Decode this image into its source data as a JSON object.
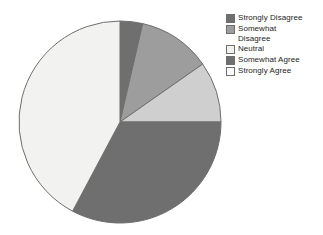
{
  "chart_data": {
    "type": "pie",
    "title": "",
    "subtitle": "",
    "xlabel": "",
    "ylabel": "",
    "grid": false,
    "legend_position": "right",
    "start_angle_deg": 0,
    "direction": "clockwise",
    "categories": [
      "Strongly Disagree",
      "Somewhat Disagree",
      "Neutral",
      "Somewhat Agree",
      "Strongly Agree"
    ],
    "values": [
      3.6,
      11.7,
      9.7,
      32.8,
      42.2
    ],
    "units": "percent",
    "slices": [
      {
        "label": "Strongly Disagree",
        "legend_label": "Strongly Disagree",
        "value": 3.6,
        "start_angle_deg": 0,
        "end_angle_deg": 13,
        "color": "#6f6f6f"
      },
      {
        "label": "Somewhat Disagree",
        "legend_label": "Somewhat\nDisagree",
        "value": 11.7,
        "start_angle_deg": 13,
        "end_angle_deg": 55,
        "color": "#9d9d9d"
      },
      {
        "label": "Neutral",
        "legend_label": "Neutral",
        "value": 9.7,
        "start_angle_deg": 55,
        "end_angle_deg": 90,
        "color": "#cfcfcf"
      },
      {
        "label": "Somewhat Agree",
        "legend_label": "Somewhat Agree",
        "value": 32.8,
        "start_angle_deg": 90,
        "end_angle_deg": 208,
        "color": "#6f6f6f"
      },
      {
        "label": "Strongly Agree",
        "legend_label": "Strongly Agree",
        "value": 42.2,
        "start_angle_deg": 208,
        "end_angle_deg": 360,
        "color": "#f2f2f0"
      }
    ],
    "geometry": {
      "center_x": 120,
      "center_y": 122,
      "radius": 101
    },
    "stroke_color": "#6e6e6e",
    "background_color": "#ffffff"
  },
  "legend": {
    "items": [
      {
        "label": "Strongly Disagree",
        "color": "#6f6f6f"
      },
      {
        "label": "Somewhat\nDisagree",
        "color": "#9d9d9d"
      },
      {
        "label": "Neutral",
        "color": "#f2f2f0"
      },
      {
        "label": "Somewhat Agree",
        "color": "#6f6f6f"
      },
      {
        "label": "Strongly Agree",
        "color": "#fbfbfb"
      }
    ]
  }
}
